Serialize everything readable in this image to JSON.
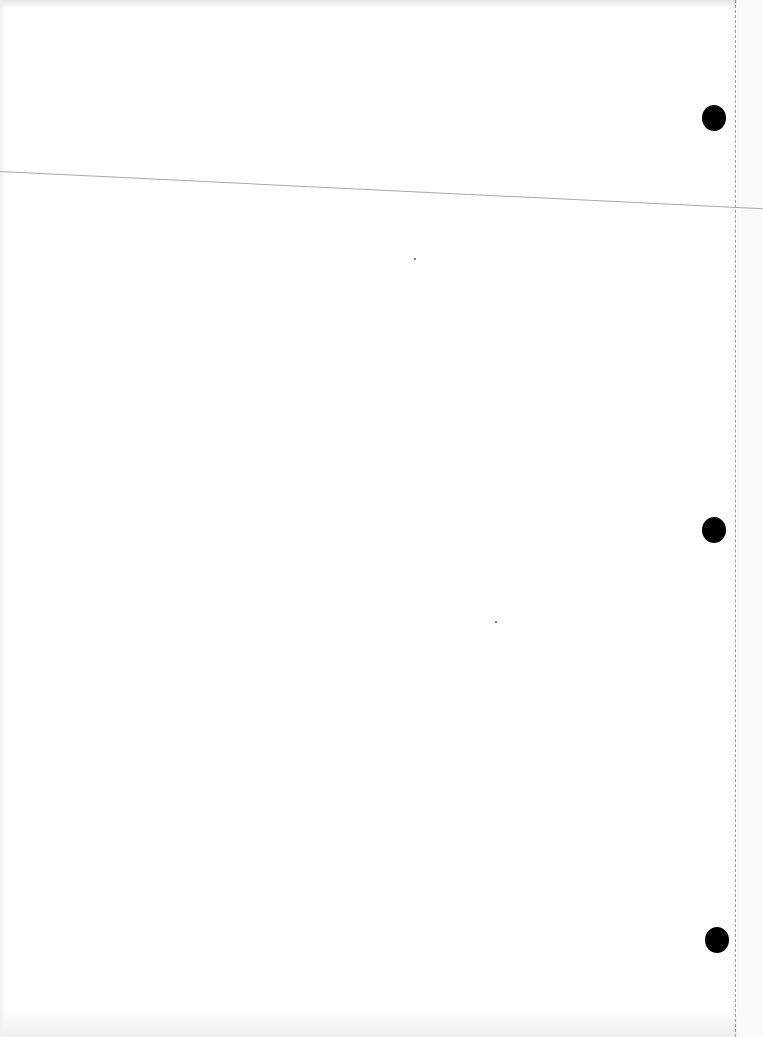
{
  "page": {
    "kind": "blank scanned sheet",
    "width": 763,
    "height": 1037,
    "background": "#ffffff"
  },
  "rule_line": {
    "color": "#a9a9a9",
    "from": [
      0,
      171
    ],
    "to": [
      763,
      212
    ]
  },
  "perforation": {
    "x": 735,
    "color": "#9a9a9a",
    "style": "dashed"
  },
  "punch_holes": [
    {
      "cx": 714,
      "cy": 118,
      "color": "#000000"
    },
    {
      "cx": 714,
      "cy": 530,
      "color": "#000000"
    },
    {
      "cx": 717,
      "cy": 940,
      "color": "#000000"
    }
  ],
  "specks": [
    {
      "x": 414,
      "y": 258
    },
    {
      "x": 495,
      "y": 621
    }
  ]
}
